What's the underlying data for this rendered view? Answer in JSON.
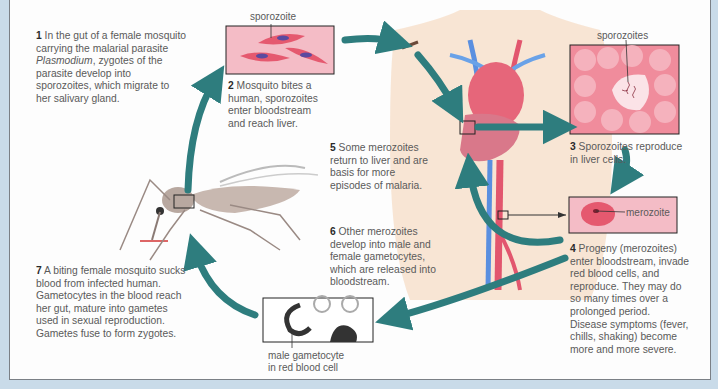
{
  "diagram": {
    "steps": [
      {
        "num": "1",
        "text_before": "In the gut of a female mosquito carrying the malarial parasite ",
        "italic": "Plasmodium",
        "text_after": ", zygotes of the parasite develop into sporozoites, which migrate to her salivary gland."
      },
      {
        "num": "2",
        "text": "Mosquito bites a human, sporozoites enter bloodstream and reach liver."
      },
      {
        "num": "3",
        "text": "Sporozoites reproduce in liver cells."
      },
      {
        "num": "4",
        "text": "Progeny (merozoites) enter bloodstream, invade red blood cells, and reproduce. They may do so many times over a prolonged period. Disease symptoms (fever, chills, shaking) become more and more severe."
      },
      {
        "num": "5",
        "text": "Some merozoites return to liver and are basis for more episodes of malaria."
      },
      {
        "num": "6",
        "text": "Other merozoites develop into male and female gametocytes, which are released into bloodstream."
      },
      {
        "num": "7",
        "text": "A biting female mosquito sucks blood from infected human. Gametocytes in the blood reach her gut, mature into gametes used in sexual reproduction. Gametes fuse to form zygotes."
      }
    ],
    "labels": {
      "sporozoite": "sporozoite",
      "sporozoites": "sporozoites",
      "merozoite": "merozoite",
      "gametocyte_line1": "male gametocyte",
      "gametocyte_line2": "in red blood cell"
    },
    "colors": {
      "arrow": "#2e7d7e",
      "cell_pink": "#f2a9b5",
      "background": "#c9dbe9",
      "panel": "#fdfdfd"
    }
  }
}
